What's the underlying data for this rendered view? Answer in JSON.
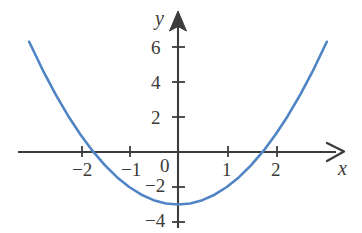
{
  "figure": {
    "name": "parabola-graph",
    "background_color": "#ffffff",
    "axis_color": "#3c3c3c",
    "curve_color": "#5184c4"
  },
  "axes": {
    "x_name": "x",
    "y_name": "y",
    "x_arrow": "right-arrow-open",
    "y_arrow": "up-arrow-filled"
  },
  "ticks": {
    "x": [
      {
        "value": -2,
        "label": "−2"
      },
      {
        "value": -1,
        "label": "−1"
      },
      {
        "value": 1,
        "label": "1"
      },
      {
        "value": 2,
        "label": "2"
      }
    ],
    "y": [
      {
        "value": 6,
        "label": "6"
      },
      {
        "value": 4,
        "label": "4"
      },
      {
        "value": 2,
        "label": "2"
      },
      {
        "value": -2,
        "label": "−2"
      },
      {
        "value": -4,
        "label": "−4"
      }
    ],
    "origin": {
      "value": 0,
      "label": "0"
    }
  },
  "chart_data": {
    "type": "line",
    "title": "",
    "xlabel": "x",
    "ylabel": "y",
    "xlim": [
      -3.4,
      3.9
    ],
    "ylim": [
      -4.6,
      7.3
    ],
    "grid": false,
    "legend": "none",
    "xticks": [
      -2,
      -1,
      0,
      1,
      2
    ],
    "yticks": [
      -4,
      -2,
      0,
      2,
      4,
      6
    ],
    "series": [
      {
        "name": "y = x^2 - 3",
        "equation": "y = x^2 - 3",
        "vertex": [
          0,
          -3
        ],
        "x_intercepts": [
          -1.73,
          1.73
        ],
        "y_intercept": -3,
        "color": "#5184c4",
        "x": [
          -3.05,
          -2.75,
          -2.5,
          -2.25,
          -2,
          -1.75,
          -1.5,
          -1.25,
          -1,
          -0.75,
          -0.5,
          -0.25,
          0,
          0.25,
          0.5,
          0.75,
          1,
          1.25,
          1.5,
          1.75,
          2,
          2.25,
          2.5,
          2.75,
          3.05
        ],
        "values": [
          6.3,
          4.56,
          3.25,
          2.06,
          1,
          0.06,
          -0.75,
          -1.44,
          -2,
          -2.44,
          -2.75,
          -2.94,
          -3,
          -2.94,
          -2.75,
          -2.44,
          -2,
          -1.44,
          -0.75,
          0.06,
          1,
          2.06,
          3.25,
          4.56,
          6.3
        ]
      }
    ]
  }
}
